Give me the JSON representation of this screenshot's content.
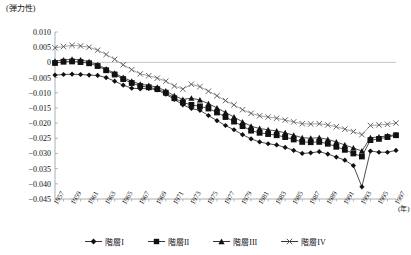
{
  "chart_data": {
    "type": "line",
    "title": "",
    "ylabel": "(弾力性)",
    "xlabel": "(年)",
    "ylim": [
      -0.045,
      0.01
    ],
    "ytick_labels": [
      "0.010",
      "0.005",
      "0",
      "−0.005",
      "−0.010",
      "−0.015",
      "−0.020",
      "−0.025",
      "−0.030",
      "−0.035",
      "−0.040",
      "−0.045"
    ],
    "ytick_values": [
      0.01,
      0.005,
      0,
      -0.005,
      -0.01,
      -0.015,
      -0.02,
      -0.025,
      -0.03,
      -0.035,
      -0.04,
      -0.045
    ],
    "grid": false,
    "legend_position": "bottom",
    "x": [
      1957,
      1958,
      1959,
      1960,
      1961,
      1962,
      1963,
      1964,
      1965,
      1966,
      1967,
      1968,
      1969,
      1970,
      1971,
      1972,
      1973,
      1974,
      1975,
      1976,
      1977,
      1978,
      1979,
      1980,
      1981,
      1982,
      1983,
      1984,
      1985,
      1986,
      1987,
      1988,
      1989,
      1990,
      1991,
      1992,
      1993,
      1994,
      1995,
      1996,
      1997
    ],
    "xtick_labels": [
      "1957",
      "1959",
      "1961",
      "1963",
      "1965",
      "1967",
      "1969",
      "1971",
      "1973",
      "1975",
      "1977",
      "1979",
      "1981",
      "1983",
      "1985",
      "1987",
      "1989",
      "1991",
      "1993",
      "1995",
      "1997"
    ],
    "series": [
      {
        "name": "階層I",
        "marker": "diamond",
        "values": [
          -0.0042,
          -0.004,
          -0.0039,
          -0.004,
          -0.0042,
          -0.0043,
          -0.005,
          -0.0062,
          -0.0075,
          -0.0085,
          -0.0087,
          -0.0086,
          -0.0091,
          -0.0105,
          -0.0122,
          -0.014,
          -0.0152,
          -0.0158,
          -0.0175,
          -0.0192,
          -0.0208,
          -0.0222,
          -0.0238,
          -0.0252,
          -0.0262,
          -0.0268,
          -0.0272,
          -0.028,
          -0.029,
          -0.03,
          -0.0298,
          -0.0294,
          -0.0302,
          -0.0312,
          -0.0322,
          -0.034,
          -0.041,
          -0.0292,
          -0.0296,
          -0.0296,
          -0.029
        ]
      },
      {
        "name": "階層II",
        "marker": "square",
        "values": [
          -0.0002,
          0.0002,
          0.0003,
          0.0001,
          -0.0003,
          -0.0012,
          -0.0026,
          -0.004,
          -0.0055,
          -0.0068,
          -0.0078,
          -0.0082,
          -0.0088,
          -0.01,
          -0.0118,
          -0.0132,
          -0.014,
          -0.0145,
          -0.0152,
          -0.0165,
          -0.018,
          -0.0195,
          -0.021,
          -0.0225,
          -0.0232,
          -0.0236,
          -0.024,
          -0.0246,
          -0.0254,
          -0.0262,
          -0.0263,
          -0.0262,
          -0.0268,
          -0.0278,
          -0.0288,
          -0.03,
          -0.031,
          -0.0256,
          -0.0252,
          -0.0246,
          -0.024
        ]
      },
      {
        "name": "階層III",
        "marker": "triangle",
        "values": [
          0.0004,
          0.0008,
          0.001,
          0.0008,
          0.0002,
          -0.0008,
          -0.0022,
          -0.0036,
          -0.005,
          -0.0062,
          -0.0072,
          -0.0076,
          -0.0082,
          -0.0094,
          -0.011,
          -0.0122,
          -0.0118,
          -0.0124,
          -0.0136,
          -0.015,
          -0.0165,
          -0.018,
          -0.0196,
          -0.021,
          -0.0218,
          -0.0222,
          -0.0226,
          -0.0232,
          -0.024,
          -0.0248,
          -0.025,
          -0.0248,
          -0.0254,
          -0.0262,
          -0.0272,
          -0.0282,
          -0.0292,
          -0.0248,
          -0.0246,
          -0.0242,
          -0.0238
        ]
      },
      {
        "name": "階層IV",
        "marker": "cross",
        "values": [
          0.0048,
          0.0052,
          0.0056,
          0.0054,
          0.005,
          0.004,
          0.0026,
          0.001,
          -0.0008,
          -0.0024,
          -0.0038,
          -0.0044,
          -0.0052,
          -0.0062,
          -0.0078,
          -0.0088,
          -0.0072,
          -0.008,
          -0.0095,
          -0.011,
          -0.0126,
          -0.014,
          -0.0156,
          -0.0168,
          -0.0176,
          -0.018,
          -0.0184,
          -0.019,
          -0.0196,
          -0.0202,
          -0.0203,
          -0.0202,
          -0.0206,
          -0.0212,
          -0.022,
          -0.0228,
          -0.0238,
          -0.0208,
          -0.0206,
          -0.0204,
          -0.02
        ]
      }
    ],
    "legend": [
      "階層I",
      "階層II",
      "階層III",
      "階層IV"
    ]
  }
}
